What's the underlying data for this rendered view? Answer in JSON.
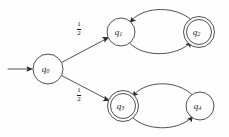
{
  "diagram": {
    "kind": "markov-chain-state-diagram",
    "canvas": {
      "width": 229,
      "height": 137
    },
    "colors": {
      "background": "#fefefe",
      "stroke": "#3c3c3c",
      "arrow": "#2a2a2a",
      "text": "#1a1a1a"
    },
    "start_marker": {
      "name": "start-arrow",
      "target": "q0"
    },
    "states": [
      {
        "id": "q0",
        "label": "q",
        "subscript": "0",
        "cx": 48,
        "cy": 69,
        "r": 15,
        "accepting": false,
        "start": true
      },
      {
        "id": "q1",
        "label": "q",
        "subscript": "1",
        "cx": 121,
        "cy": 32,
        "r": 14,
        "accepting": false,
        "start": false
      },
      {
        "id": "q2",
        "label": "q",
        "subscript": "2",
        "cx": 199,
        "cy": 32,
        "r": 15.5,
        "r_inner": 12.5,
        "accepting": true,
        "start": false
      },
      {
        "id": "q3",
        "label": "q",
        "subscript": "3",
        "cx": 123,
        "cy": 106,
        "r": 15.5,
        "r_inner": 12.5,
        "accepting": true,
        "start": false
      },
      {
        "id": "q4",
        "label": "q",
        "subscript": "4",
        "cx": 200,
        "cy": 106,
        "r": 14,
        "accepting": false,
        "start": false
      }
    ],
    "transitions": [
      {
        "id": "t-q0-q1",
        "from": "q0",
        "to": "q1",
        "shape": "straight",
        "weight_numerator": "1",
        "weight_denominator": "2",
        "weight_display": "1/2",
        "label_x": 79,
        "label_y": 27
      },
      {
        "id": "t-q0-q3",
        "from": "q0",
        "to": "q3",
        "shape": "straight",
        "weight_numerator": "1",
        "weight_denominator": "2",
        "weight_display": "1/2",
        "label_x": 79,
        "label_y": 93
      },
      {
        "id": "t-q1-q2",
        "from": "q1",
        "to": "q2",
        "shape": "curve-lower",
        "weight_display": ""
      },
      {
        "id": "t-q2-q1",
        "from": "q2",
        "to": "q1",
        "shape": "curve-upper",
        "weight_display": ""
      },
      {
        "id": "t-q3-q4",
        "from": "q3",
        "to": "q4",
        "shape": "curve-lower",
        "weight_display": ""
      },
      {
        "id": "t-q4-q3",
        "from": "q4",
        "to": "q3",
        "shape": "curve-upper",
        "weight_display": ""
      }
    ]
  }
}
